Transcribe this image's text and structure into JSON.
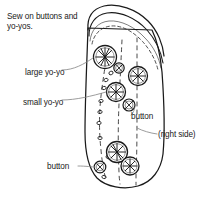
{
  "illustration": {
    "title": "Sew on buttons and yo-yos.",
    "subject": "garment-piece-with-folded-cuff",
    "colors": {
      "background": "#ffffff",
      "ink": "#1a1a1a",
      "leader_line": "#8a8a8a",
      "dashed_guide": "#333333"
    }
  },
  "heading": {
    "text": "Sew on buttons and yo-yos."
  },
  "labels": {
    "large_yoyo": "large yo-yo",
    "small_yoyo": "small yo-yo",
    "button_right": "button",
    "right_side": "(right side)",
    "button_left": "button"
  },
  "parts": {
    "yoyos": [
      {
        "name": "large-yo-yo",
        "cx": 105,
        "cy": 57,
        "r": 11.5,
        "rays": 10
      },
      {
        "name": "yo-yo-upper-right",
        "cx": 138,
        "cy": 76,
        "r": 9.5,
        "rays": 9
      },
      {
        "name": "small-yo-yo",
        "cx": 116,
        "cy": 92,
        "r": 9.5,
        "rays": 9
      },
      {
        "name": "yo-yo-lower-left",
        "cx": 117,
        "cy": 152,
        "r": 10.5,
        "rays": 10
      },
      {
        "name": "yo-yo-lower-right",
        "cx": 130,
        "cy": 166,
        "r": 9,
        "rays": 9
      }
    ],
    "buttons": [
      {
        "name": "button-upper",
        "cx": 119,
        "cy": 68,
        "r": 5.2
      },
      {
        "name": "button-middle",
        "cx": 129,
        "cy": 105,
        "r": 6.0
      },
      {
        "name": "button-lower",
        "cx": 100,
        "cy": 167,
        "r": 5.8
      }
    ],
    "guide_lines": 3,
    "stitch_marks": 9
  }
}
